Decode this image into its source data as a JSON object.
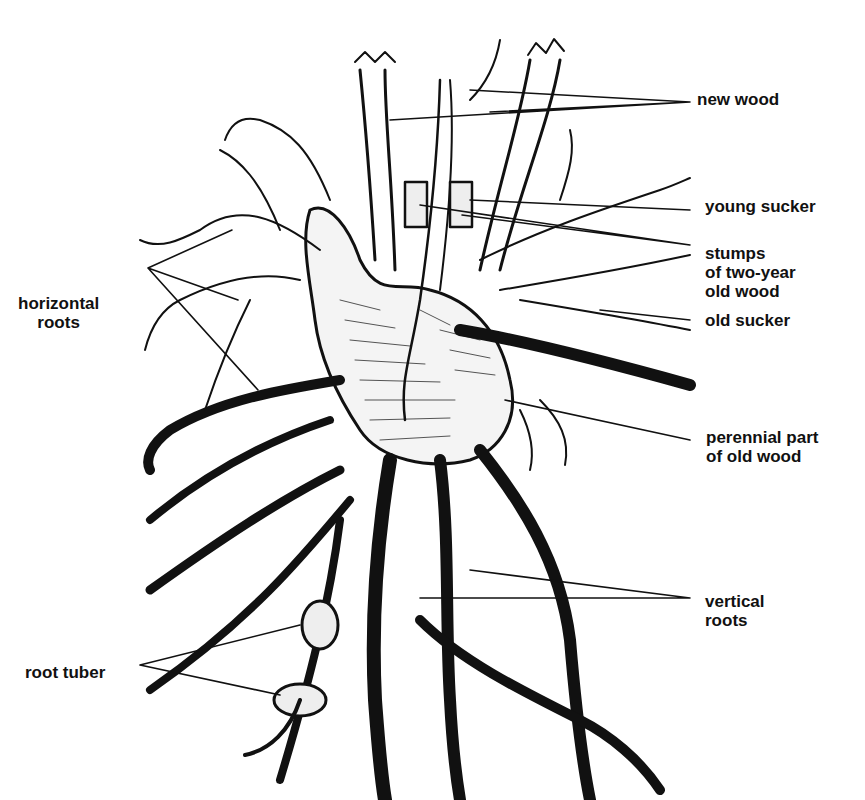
{
  "diagram": {
    "labels": {
      "new_wood": "new wood",
      "young_sucker": "young sucker",
      "stumps": "stumps\nof two-year\nold wood",
      "old_sucker": "old sucker",
      "perennial": "perennial part\nof old wood",
      "vertical_roots": "vertical\nroots",
      "horizontal_roots": "horizontal\nroots",
      "root_tuber": "root tuber"
    },
    "colors": {
      "ink": "#111111",
      "background": "#ffffff"
    }
  }
}
